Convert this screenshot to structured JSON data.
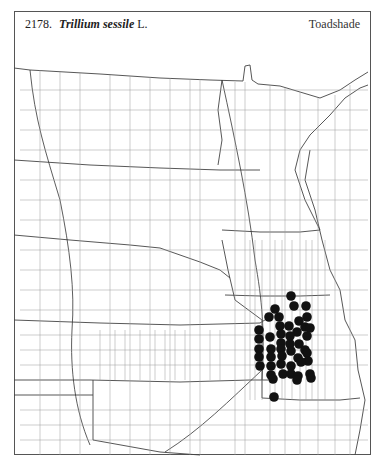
{
  "header": {
    "number": "2178.",
    "scientific_name": "Trillium sessile",
    "authority": "L.",
    "common_name": "Toadshade"
  },
  "map": {
    "region": "Great Plains (county outline map)",
    "marker_color": "#111111",
    "line_color": "#8a8a8a",
    "border_color": "#333333",
    "occurrence_points": [
      [
        291,
        296
      ],
      [
        294,
        306
      ],
      [
        306,
        306
      ],
      [
        275,
        309
      ],
      [
        307,
        317
      ],
      [
        269,
        317
      ],
      [
        279,
        317
      ],
      [
        299,
        321
      ],
      [
        289,
        326
      ],
      [
        280,
        326
      ],
      [
        305,
        327
      ],
      [
        310,
        328
      ],
      [
        259,
        330
      ],
      [
        297,
        332
      ],
      [
        281,
        334
      ],
      [
        307,
        336
      ],
      [
        290,
        336
      ],
      [
        270,
        337
      ],
      [
        259,
        339
      ],
      [
        281,
        343
      ],
      [
        290,
        344
      ],
      [
        299,
        344
      ],
      [
        259,
        349
      ],
      [
        271,
        349
      ],
      [
        281,
        349
      ],
      [
        291,
        351
      ],
      [
        305,
        350
      ],
      [
        307,
        353
      ],
      [
        259,
        357
      ],
      [
        271,
        357
      ],
      [
        282,
        356
      ],
      [
        298,
        358
      ],
      [
        308,
        361
      ],
      [
        271,
        366
      ],
      [
        281,
        364
      ],
      [
        291,
        366
      ],
      [
        301,
        362
      ],
      [
        260,
        366
      ],
      [
        271,
        375
      ],
      [
        283,
        374
      ],
      [
        291,
        374
      ],
      [
        298,
        376
      ],
      [
        310,
        374
      ],
      [
        273,
        379
      ],
      [
        297,
        380
      ],
      [
        311,
        378
      ],
      [
        274,
        397
      ]
    ]
  }
}
